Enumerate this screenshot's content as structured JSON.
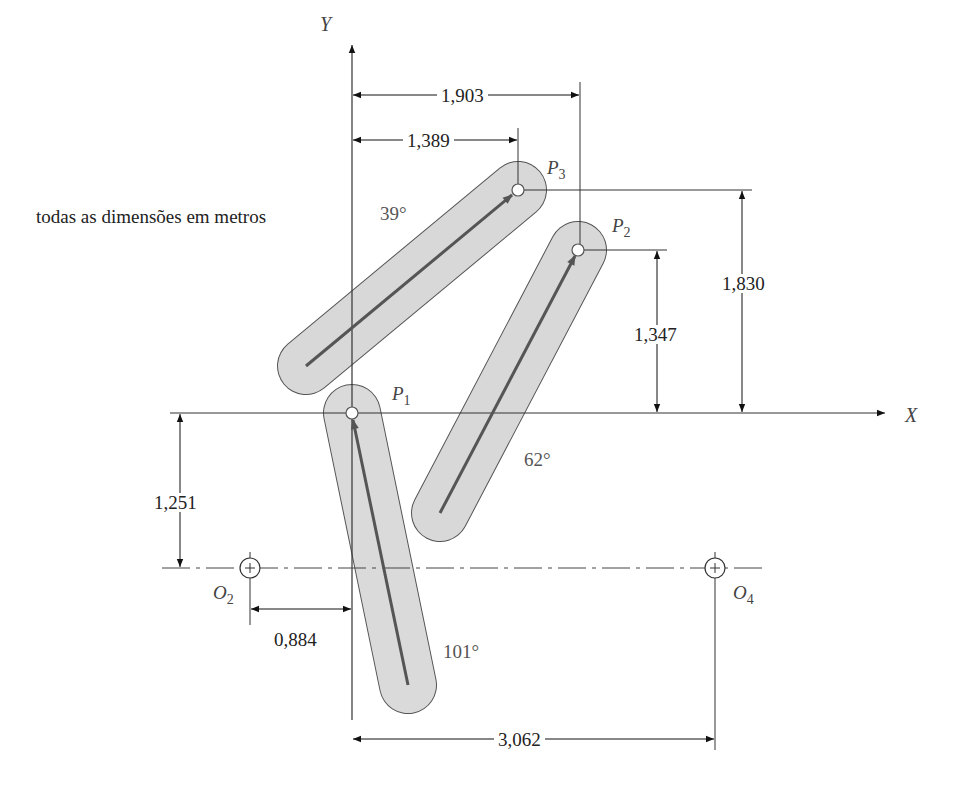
{
  "note": "todas as dimensões em metros",
  "axes": {
    "x_label": "X",
    "y_label": "Y"
  },
  "points": {
    "P1": {
      "letter": "P",
      "sub": "1"
    },
    "P2": {
      "letter": "P",
      "sub": "2"
    },
    "P3": {
      "letter": "P",
      "sub": "3"
    },
    "O2": {
      "letter": "O",
      "sub": "2"
    },
    "O4": {
      "letter": "O",
      "sub": "4"
    }
  },
  "dimensions": {
    "p2_x": "1,903",
    "p3_x": "1,389",
    "p3_y": "1,830",
    "p2_y": "1,347",
    "o2_y": "1,251",
    "o2_x": "0,884",
    "o4_x": "3,062"
  },
  "angles": {
    "link_p3": "39°",
    "link_p2": "62°",
    "link_p1": "101°"
  },
  "colors": {
    "link_fill": "#d6d6d6",
    "link_stroke": "#555555",
    "arrow": "#555555",
    "line": "#333333"
  }
}
